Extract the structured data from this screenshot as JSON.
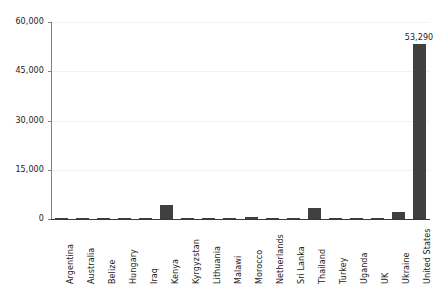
{
  "chart_data": {
    "type": "bar",
    "title": "",
    "subtitle": "",
    "xlabel": "",
    "ylabel": "",
    "ylim": [
      0,
      60000
    ],
    "yticks": [
      "0",
      "15,000",
      "30,000",
      "45,000",
      "60,000"
    ],
    "ytick_values": [
      0,
      15000,
      30000,
      45000,
      60000
    ],
    "grid": true,
    "legend": "none",
    "bar_color": "#404040",
    "categories": [
      "Argentina",
      "Australia",
      "Belize",
      "Hungary",
      "Iraq",
      "Kenya",
      "Kyrgyzstan",
      "Lithuania",
      "Malawi",
      "Morocco",
      "Netherlands",
      "Sri Lanka",
      "Thailand",
      "Turkey",
      "Uganda",
      "UK",
      "Ukraine",
      "United States"
    ],
    "values": [
      120,
      90,
      80,
      110,
      150,
      4200,
      260,
      100,
      90,
      700,
      130,
      200,
      3500,
      140,
      110,
      120,
      2000,
      53290
    ],
    "data_labels": {
      "United States": "53,290"
    }
  }
}
